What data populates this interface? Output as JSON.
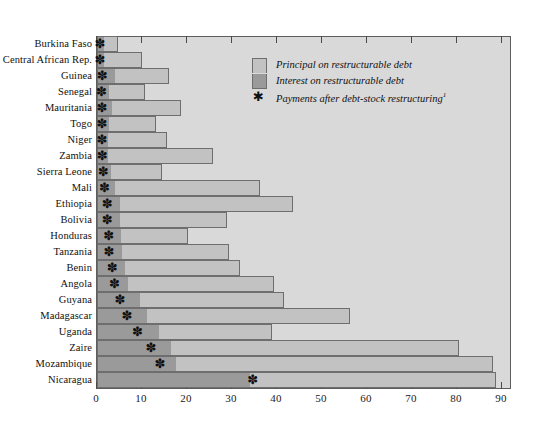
{
  "chart_data": {
    "type": "bar",
    "orientation": "horizontal",
    "stacked": true,
    "title": "",
    "xlabel": "",
    "ylabel": "",
    "xlim": [
      0,
      92
    ],
    "xticks": [
      0,
      10,
      20,
      30,
      40,
      50,
      60,
      70,
      80,
      90
    ],
    "xtick_labels": [
      "0",
      "10",
      "20",
      "30",
      "40",
      "50",
      "60",
      "70",
      "80",
      "90"
    ],
    "grid": false,
    "legend_position": "top-right",
    "categories": [
      "Burkina Faso",
      "Central African Rep.",
      "Guinea",
      "Senegal",
      "Mauritania",
      "Togo",
      "Niger",
      "Zambia",
      "Sierra Leone",
      "Mali",
      "Ethiopia",
      "Bolivia",
      "Honduras",
      "Tanzania",
      "Benin",
      "Angola",
      "Guyana",
      "Madagascar",
      "Uganda",
      "Zaire",
      "Mozambique",
      "Nicaragua"
    ],
    "series": [
      {
        "name": "Interest on restructurable debt",
        "color": "#9a9a9a",
        "values": [
          1.6,
          1.6,
          3.9,
          2.6,
          3.4,
          2.6,
          2.4,
          2.4,
          3.0,
          4.0,
          5.1,
          5.2,
          5.4,
          5.6,
          6.2,
          6.9,
          9.6,
          11.0,
          13.8,
          16.5,
          17.5,
          34.0
        ]
      },
      {
        "name": "Principal on restructurable debt",
        "color": "#c2c2c2",
        "values": [
          3.1,
          8.4,
          12.1,
          8.0,
          15.2,
          10.6,
          13.2,
          23.4,
          11.5,
          32.2,
          38.4,
          23.6,
          14.8,
          23.8,
          25.6,
          32.5,
          31.9,
          45.2,
          25.2,
          63.9,
          70.5,
          54.7
        ]
      }
    ],
    "totals": [
      4.7,
      10.0,
      16.0,
      10.6,
      18.6,
      13.2,
      15.6,
      25.8,
      14.5,
      36.2,
      43.5,
      28.8,
      20.2,
      29.4,
      31.8,
      39.4,
      41.5,
      56.2,
      39.0,
      80.4,
      88.0,
      88.7
    ],
    "markers": {
      "name": "Payments after debt-stock restructuring",
      "symbol": "*",
      "values": [
        0.9,
        0.9,
        1.4,
        1.2,
        1.3,
        1.3,
        1.3,
        1.4,
        1.6,
        1.9,
        2.5,
        2.5,
        2.8,
        2.9,
        3.6,
        4.1,
        5.3,
        6.9,
        9.2,
        12.2,
        14.2,
        34.8
      ]
    },
    "legend": [
      {
        "label": "Principal on restructurable debt",
        "swatch": "principal"
      },
      {
        "label": "Interest on restructurable debt",
        "swatch": "interest"
      },
      {
        "label": "Payments after debt-stock restructuring",
        "swatch": "star",
        "footnote": "1"
      }
    ]
  }
}
